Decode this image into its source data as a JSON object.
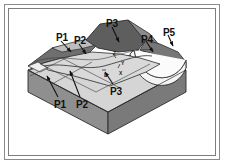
{
  "figure": {
    "frame": {
      "style": "double-rule rectangular border",
      "outer_color": "#8a8a8a",
      "inner_color": "#7d7d7d"
    },
    "colors": {
      "background": "#ffffff",
      "top_surface_light": "#d9d9d9",
      "top_surface_mid": "#c2c2c2",
      "ridge_dark": "#6e6e6e",
      "ridge_darker": "#5c5c5c",
      "front_face": "#8f8f8f",
      "right_face": "#7a7a7a",
      "cut_surface": "#f2f2f2",
      "outline": "#2b2b2b",
      "label_text": "#111111"
    },
    "callouts": [
      {
        "id": "p1-top",
        "label": "P1",
        "x": 56,
        "y": 33,
        "arrow_to_x": 72,
        "arrow_to_y": 50
      },
      {
        "id": "p2-top",
        "label": "P2",
        "x": 74,
        "y": 36,
        "arrow_to_x": 85,
        "arrow_to_y": 52
      },
      {
        "id": "p3-top",
        "label": "P3",
        "x": 106,
        "y": 19,
        "arrow_to_x": 117,
        "arrow_to_y": 41
      },
      {
        "id": "p4",
        "label": "P4",
        "x": 141,
        "y": 35,
        "arrow_to_x": 152,
        "arrow_to_y": 51
      },
      {
        "id": "p5",
        "label": "P5",
        "x": 163,
        "y": 28,
        "arrow_to_x": 171,
        "arrow_to_y": 45
      },
      {
        "id": "p3-bottom",
        "label": "P3",
        "x": 110,
        "y": 87,
        "arrow_to_x": 104,
        "arrow_to_y": 72
      },
      {
        "id": "p1-bottom",
        "label": "P1",
        "x": 54,
        "y": 100,
        "arrow_to_x": 46,
        "arrow_to_y": 76
      },
      {
        "id": "p2-bottom",
        "label": "P2",
        "x": 76,
        "y": 100,
        "arrow_to_x": 69,
        "arrow_to_y": 72
      }
    ],
    "axis_marks": [
      {
        "id": "axis-z",
        "label": "Z",
        "x": 113,
        "y": 51
      },
      {
        "id": "axis-y",
        "label": "Y",
        "x": 121,
        "y": 61
      },
      {
        "id": "axis-d",
        "label": "D",
        "x": 104,
        "y": 73
      },
      {
        "id": "axis-x",
        "label": "X",
        "x": 119,
        "y": 71
      }
    ]
  }
}
